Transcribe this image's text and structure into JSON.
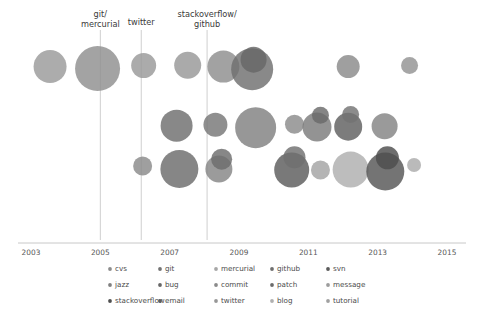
{
  "chart_data": {
    "type": "scatter",
    "title": "",
    "xlabel": "",
    "ylabel": "",
    "xlim": [
      2002.5,
      2015.4
    ],
    "ylim": [
      0,
      10
    ],
    "grid": false,
    "legend_position": "bottom",
    "xticks": [
      2003,
      2005,
      2007,
      2009,
      2011,
      2013,
      2015
    ],
    "xtick_labels": [
      "2003",
      "2005",
      "2007",
      "2009",
      "2011",
      "2013",
      "2015"
    ],
    "annotations": [
      {
        "label": "git/\nmercurial",
        "line1": "git/",
        "line2": "mercurial",
        "x": 2005.0
      },
      {
        "label": "twitter",
        "line1": "twitter",
        "line2": "",
        "x": 2006.18
      },
      {
        "label": "stackoverflow/\ngithub",
        "line1": "stackoverflow/",
        "line2": "github",
        "x": 2008.08
      }
    ],
    "series": [
      {
        "name": "cvs",
        "color": "#8c8c8c"
      },
      {
        "name": "git",
        "color": "#737373"
      },
      {
        "name": "mercurial",
        "color": "#a6a6a6"
      },
      {
        "name": "github",
        "color": "#6e6e6e"
      },
      {
        "name": "svn",
        "color": "#5a5a5a"
      },
      {
        "name": "jazz",
        "color": "#808080"
      },
      {
        "name": "bug",
        "color": "#666666"
      },
      {
        "name": "commit",
        "color": "#8a8a8a"
      },
      {
        "name": "patch",
        "color": "#6b6b6b"
      },
      {
        "name": "message",
        "color": "#9c9c9c"
      },
      {
        "name": "stackoverflow",
        "color": "#4f4f4f"
      },
      {
        "name": "email",
        "color": "#5e5e5e"
      },
      {
        "name": "twitter",
        "color": "#979797"
      },
      {
        "name": "blog",
        "color": "#b0b0b0"
      },
      {
        "name": "tutorial",
        "color": "#a0a0a0"
      }
    ],
    "bubbles": [
      {
        "series": "cvs",
        "x": 2003.55,
        "y": 8.55,
        "r": 16.5,
        "color": "#9a9a9a"
      },
      {
        "series": "cvs",
        "x": 2004.92,
        "y": 8.45,
        "r": 22.5,
        "color": "#8f8f8f"
      },
      {
        "series": "mercurial",
        "x": 2006.25,
        "y": 8.6,
        "r": 12.5,
        "color": "#999999"
      },
      {
        "series": "git",
        "x": 2007.52,
        "y": 8.62,
        "r": 13.5,
        "color": "#979797"
      },
      {
        "series": "git",
        "x": 2008.55,
        "y": 8.55,
        "r": 16.0,
        "color": "#8d8d8d"
      },
      {
        "series": "github",
        "x": 2009.38,
        "y": 8.42,
        "r": 21.0,
        "color": "#6f6f6f"
      },
      {
        "series": "github",
        "x": 2009.42,
        "y": 8.9,
        "r": 13.0,
        "color": "#666666"
      },
      {
        "series": "svn",
        "x": 2012.15,
        "y": 8.55,
        "r": 11.5,
        "color": "#8a8a8a"
      },
      {
        "series": "svn",
        "x": 2013.92,
        "y": 8.6,
        "r": 8.5,
        "color": "#929292"
      },
      {
        "series": "bug",
        "x": 2007.2,
        "y": 5.55,
        "r": 16.0,
        "color": "#6e6e6e"
      },
      {
        "series": "bug",
        "x": 2008.32,
        "y": 5.6,
        "r": 12.0,
        "color": "#767676"
      },
      {
        "series": "commit",
        "x": 2009.48,
        "y": 5.45,
        "r": 20.5,
        "color": "#808080"
      },
      {
        "series": "patch",
        "x": 2010.6,
        "y": 5.62,
        "r": 9.5,
        "color": "#8b8b8b"
      },
      {
        "series": "patch",
        "x": 2011.25,
        "y": 5.48,
        "r": 14.5,
        "color": "#7b7b7b"
      },
      {
        "series": "message",
        "x": 2011.35,
        "y": 6.08,
        "r": 8.5,
        "color": "#6a6a6a"
      },
      {
        "series": "message",
        "x": 2012.15,
        "y": 5.5,
        "r": 14.0,
        "color": "#5f5f5f"
      },
      {
        "series": "jazz",
        "x": 2012.22,
        "y": 6.12,
        "r": 8.5,
        "color": "#737373"
      },
      {
        "series": "jazz",
        "x": 2013.2,
        "y": 5.52,
        "r": 13.0,
        "color": "#848484"
      },
      {
        "series": "email",
        "x": 2006.22,
        "y": 3.5,
        "r": 9.5,
        "color": "#8a8a8a"
      },
      {
        "series": "email",
        "x": 2007.28,
        "y": 3.35,
        "r": 19.0,
        "color": "#6b6b6b"
      },
      {
        "series": "twitter",
        "x": 2008.42,
        "y": 3.35,
        "r": 13.5,
        "color": "#858585"
      },
      {
        "series": "twitter",
        "x": 2008.5,
        "y": 3.85,
        "r": 10.5,
        "color": "#6d6d6d"
      },
      {
        "series": "blog",
        "x": 2010.52,
        "y": 3.3,
        "r": 17.5,
        "color": "#5c5c5c"
      },
      {
        "series": "blog",
        "x": 2010.6,
        "y": 3.95,
        "r": 11.0,
        "color": "#6f6f6f"
      },
      {
        "series": "tutorial",
        "x": 2011.35,
        "y": 3.3,
        "r": 9.5,
        "color": "#a3a3a3"
      },
      {
        "series": "tutorial",
        "x": 2012.22,
        "y": 3.32,
        "r": 18.0,
        "color": "#aeaeae"
      },
      {
        "series": "stackoverflow",
        "x": 2013.22,
        "y": 3.22,
        "r": 19.0,
        "color": "#565656"
      },
      {
        "series": "stackoverflow",
        "x": 2013.28,
        "y": 3.92,
        "r": 11.5,
        "color": "#4d4d4d"
      },
      {
        "series": "blog",
        "x": 2014.05,
        "y": 3.55,
        "r": 7.0,
        "color": "#ababab"
      }
    ]
  },
  "legend": {
    "rows": [
      [
        {
          "label": "cvs",
          "color": "#8c8c8c"
        },
        {
          "label": "git",
          "color": "#737373"
        },
        {
          "label": "mercurial",
          "color": "#a6a6a6"
        },
        {
          "label": "github",
          "color": "#6e6e6e"
        },
        {
          "label": "svn",
          "color": "#5a5a5a"
        }
      ],
      [
        {
          "label": "jazz",
          "color": "#808080"
        },
        {
          "label": "bug",
          "color": "#666666"
        },
        {
          "label": "commit",
          "color": "#8a8a8a"
        },
        {
          "label": "patch",
          "color": "#6b6b6b"
        },
        {
          "label": "message",
          "color": "#9c9c9c"
        }
      ],
      [
        {
          "label": "stackoverflow",
          "color": "#4f4f4f"
        },
        {
          "label": "email",
          "color": "#5e5e5e"
        },
        {
          "label": "twitter",
          "color": "#979797"
        },
        {
          "label": "blog",
          "color": "#b0b0b0"
        },
        {
          "label": "tutorial",
          "color": "#a0a0a0"
        }
      ]
    ]
  },
  "axis": {
    "line_color": "#c8c8c8",
    "annotation_line_color": "#c9c9c9"
  }
}
